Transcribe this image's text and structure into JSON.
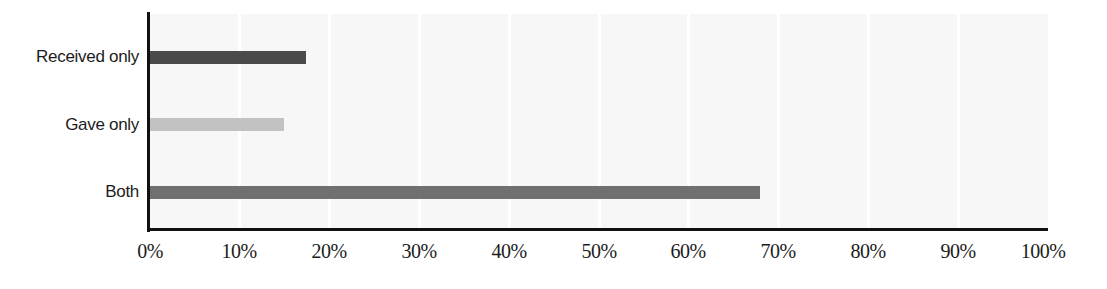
{
  "chart_data": {
    "type": "bar",
    "orientation": "horizontal",
    "title": "",
    "subtitle": "",
    "xlabel": "",
    "ylabel": "",
    "categories": [
      "Received only",
      "Gave only",
      "Both"
    ],
    "values": [
      17.5,
      15.0,
      68.0
    ],
    "value_labels": [
      "17.5%",
      "15.0%",
      "68.0%"
    ],
    "bar_colors": [
      "#4a4a4a",
      "#c2c2c2",
      "#707070"
    ],
    "xlim": [
      0,
      100
    ],
    "xtick_values": [
      0,
      10,
      20,
      30,
      40,
      50,
      60,
      70,
      80,
      90,
      100
    ],
    "xtick_labels": [
      "0%",
      "10%",
      "20%",
      "30%",
      "40%",
      "50%",
      "60%",
      "70%",
      "80%",
      "90%",
      "100%"
    ],
    "grid": true,
    "grid_axis": "x",
    "grid_color": "#ffffff",
    "legend": false,
    "legend_position": "none",
    "plot_background": "#f7f7f7",
    "figure_background": "#ffffff",
    "axis_color": "#111111",
    "text_color": "#1c1c1c"
  },
  "axes": {
    "y_categories": [
      {
        "label": "Received only"
      },
      {
        "label": "Gave only"
      },
      {
        "label": "Both"
      }
    ],
    "x_ticks": [
      {
        "label": "0%"
      },
      {
        "label": "10%"
      },
      {
        "label": "20%"
      },
      {
        "label": "30%"
      },
      {
        "label": "40%"
      },
      {
        "label": "50%"
      },
      {
        "label": "60%"
      },
      {
        "label": "70%"
      },
      {
        "label": "80%"
      },
      {
        "label": "90%"
      },
      {
        "label": "100%"
      }
    ]
  }
}
